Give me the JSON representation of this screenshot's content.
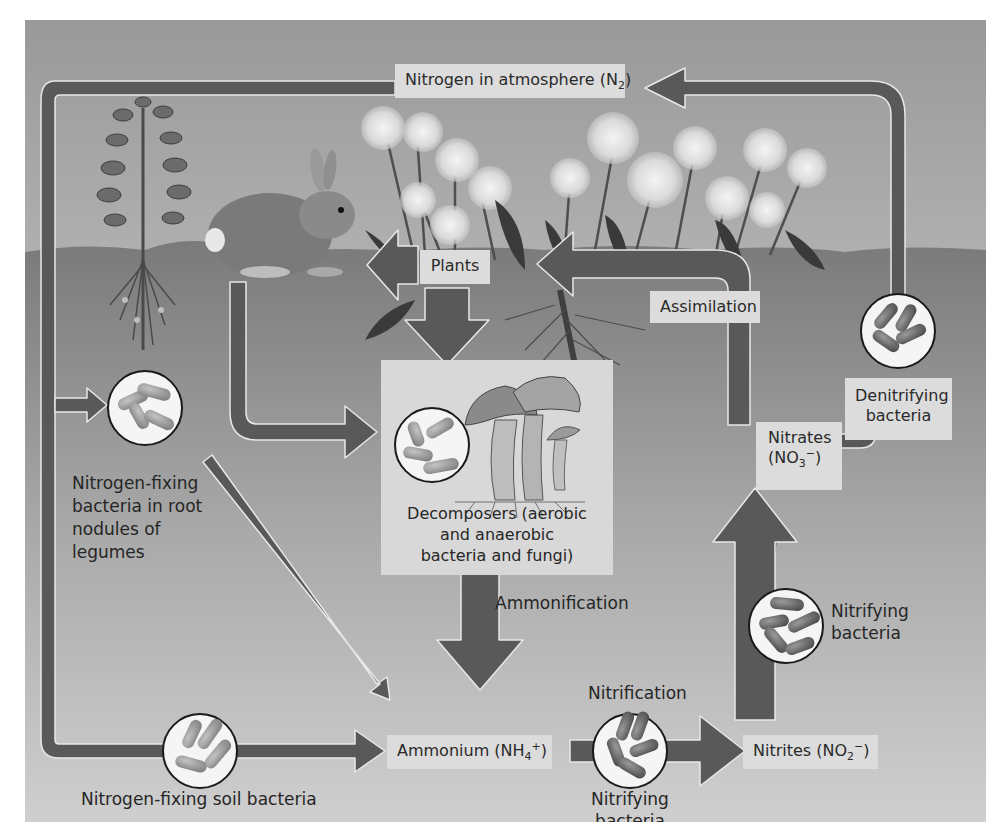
{
  "diagram": {
    "colors": {
      "arrow": "#595959",
      "arrow_outline": "#e6e6e6",
      "sky_top": "#9a9a9a",
      "sky_bottom": "#e4e4e4",
      "soil_top": "#7d7d7d",
      "soil_bottom": "#c9c9c9",
      "label_bg": "#dcdcdc",
      "text": "#262626"
    },
    "nodes": {
      "atmosphere": {
        "text": "Nitrogen in atmosphere (N",
        "sub": "2",
        "close": ")"
      },
      "plants": {
        "text": "Plants"
      },
      "assimilation": {
        "text": "Assimilation"
      },
      "decomposers": {
        "lines": [
          "Decomposers (aerobic",
          "and anaerobic",
          "bacteria and fungi)"
        ]
      },
      "ammonification": {
        "text": "Ammonification"
      },
      "ammonium": {
        "text": "Ammonium (NH",
        "sub": "4",
        "sup": "+",
        "close": ")"
      },
      "nitrification": {
        "text": "Nitrification"
      },
      "nitrifying_bottom": {
        "lines": [
          "Nitrifying",
          "bacteria"
        ]
      },
      "nitrites": {
        "text": "Nitrites (NO",
        "sub": "2",
        "sup": "−",
        "close": ")"
      },
      "nitrifying_right": {
        "lines": [
          "Nitrifying",
          "bacteria"
        ]
      },
      "nitrates": {
        "line1": "Nitrates",
        "text": "(NO",
        "sub": "3",
        "sup": "−",
        "close": ")"
      },
      "denitrifying": {
        "lines": [
          "Denitrifying",
          "bacteria"
        ]
      },
      "root_nodule_bacteria": {
        "lines": [
          "Nitrogen-fixing",
          "bacteria in root",
          "nodules of",
          "legumes"
        ]
      },
      "soil_bacteria": {
        "text": "Nitrogen-fixing soil bacteria"
      }
    },
    "illustrations": [
      "legume-plant",
      "rabbit",
      "dandelions",
      "mushrooms"
    ],
    "bacteria_circles": [
      "root-nodule",
      "decomposer",
      "soil-fixing",
      "nitrifying-bottom",
      "nitrifying-right",
      "denitrifying"
    ],
    "flows": [
      {
        "from": "Denitrifying bacteria",
        "to": "Nitrogen in atmosphere (N2)"
      },
      {
        "from": "Nitrogen in atmosphere (N2)",
        "to": "Nitrogen-fixing bacteria in root nodules of legumes"
      },
      {
        "from": "Nitrogen in atmosphere (N2)",
        "to": "Nitrogen-fixing soil bacteria"
      },
      {
        "from": "Nitrogen-fixing soil bacteria",
        "to": "Ammonium (NH4+)"
      },
      {
        "from": "Nitrogen-fixing bacteria in root nodules of legumes",
        "to": "Ammonium (NH4+)"
      },
      {
        "from": "Plants",
        "to": "Animals"
      },
      {
        "from": "Animals",
        "to": "Decomposers"
      },
      {
        "from": "Plants",
        "to": "Decomposers"
      },
      {
        "from": "Decomposers",
        "to": "Ammonium (NH4+)",
        "label": "Ammonification"
      },
      {
        "from": "Ammonium (NH4+)",
        "to": "Nitrites (NO2-)",
        "label": "Nitrification"
      },
      {
        "from": "Nitrites (NO2-)",
        "to": "Nitrates (NO3-)"
      },
      {
        "from": "Nitrates (NO3-)",
        "to": "Plants",
        "label": "Assimilation"
      },
      {
        "from": "Nitrates (NO3-)",
        "to": "Denitrifying bacteria"
      }
    ]
  }
}
